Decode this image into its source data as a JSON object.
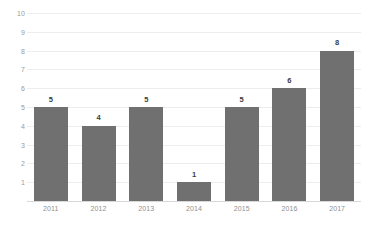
{
  "chart_data": {
    "type": "bar",
    "title": "",
    "subtitle": "",
    "xlabel": "",
    "ylabel": "",
    "categories": [
      "2011",
      "2012",
      "2013",
      "2014",
      "2015",
      "2016",
      "2017"
    ],
    "values": [
      5,
      4,
      5,
      1,
      5,
      6,
      8
    ],
    "data_labels": [
      "5",
      "4",
      "5",
      "1",
      "5",
      "6",
      "8"
    ],
    "ylim": [
      0,
      10
    ],
    "ytick_labels": [
      "10",
      "9",
      "8",
      "7",
      "6",
      "5",
      "4",
      "3",
      "2",
      "1"
    ],
    "ytick_values": [
      10,
      9,
      8,
      7,
      6,
      5,
      4,
      3,
      2,
      1
    ],
    "grid": true,
    "grid_axis": "y",
    "legend": false,
    "legend_position": "none",
    "bar_color": "#707070",
    "gridline_color": "#ededed",
    "axis_line_color": "#d8d8d8",
    "tick_label_color": "#9a9a9a",
    "data_label_color": "#3b3b3b",
    "background_color": "#ffffff"
  }
}
